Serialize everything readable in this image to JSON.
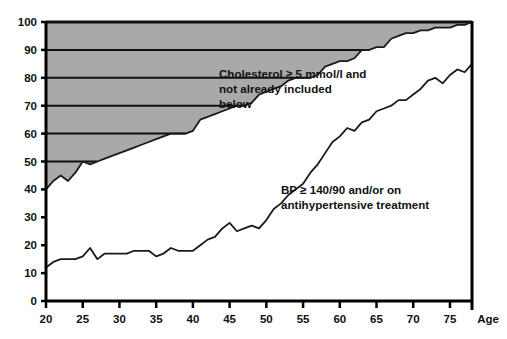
{
  "chart_data": {
    "type": "area",
    "title": "",
    "subtitle": "",
    "xlabel": "Age",
    "ylabel": "",
    "xlim": [
      20,
      78
    ],
    "ylim": [
      0,
      100
    ],
    "xticks": [
      20,
      25,
      30,
      35,
      40,
      45,
      50,
      55,
      60,
      65,
      70,
      75
    ],
    "yticks": [
      0,
      10,
      20,
      30,
      40,
      50,
      60,
      70,
      80,
      90,
      100
    ],
    "grid": "horizontal gridlines at 50, 60, 70, 80, 90, 100 drawn only inside the shaded region",
    "legend_position": "inline annotations inside plot",
    "fill_color": "#a9a9a9",
    "line_color": "#1a1a1a",
    "axis_color": "#000000",
    "background": "#ffffff",
    "annotations": [
      {
        "name": "cholesterol-annotation",
        "text_lines": [
          "Cholesterol ≥ 5 mmol/l and",
          "not already included",
          "below"
        ],
        "x_px": 219,
        "y_px": 78
      },
      {
        "name": "bp-annotation",
        "text_lines": [
          "BP ≥ 140/90 and/or on",
          "antihypertensive treatment"
        ],
        "x_px": 281,
        "y_px": 194
      }
    ],
    "series": [
      {
        "name": "Cholesterol ≥ 5 mmol/l and not already included below",
        "filled": true,
        "x": [
          20,
          21,
          22,
          23,
          24,
          25,
          26,
          27,
          28,
          29,
          30,
          31,
          32,
          33,
          34,
          35,
          36,
          37,
          38,
          39,
          40,
          41,
          42,
          43,
          44,
          45,
          46,
          47,
          48,
          49,
          50,
          51,
          52,
          53,
          54,
          55,
          56,
          57,
          58,
          59,
          60,
          61,
          62,
          63,
          64,
          65,
          66,
          67,
          68,
          69,
          70,
          71,
          72,
          73,
          74,
          75,
          76,
          77,
          78
        ],
        "values": [
          40,
          43,
          45,
          43,
          46,
          50,
          49,
          50,
          51,
          52,
          53,
          54,
          55,
          56,
          57,
          58,
          59,
          60,
          60,
          60,
          61,
          65,
          66,
          67,
          68,
          69,
          70,
          70,
          71,
          74,
          75,
          76,
          77,
          79,
          80,
          80,
          80,
          81,
          84,
          85,
          86,
          86,
          87,
          90,
          90,
          91,
          91,
          94,
          95,
          96,
          96,
          97,
          97,
          98,
          98,
          98,
          99,
          99,
          100
        ]
      },
      {
        "name": "BP ≥ 140/90 and/or on antihypertensive treatment",
        "filled": false,
        "x": [
          20,
          21,
          22,
          23,
          24,
          25,
          26,
          27,
          28,
          29,
          30,
          31,
          32,
          33,
          34,
          35,
          36,
          37,
          38,
          39,
          40,
          41,
          42,
          43,
          44,
          45,
          46,
          47,
          48,
          49,
          50,
          51,
          52,
          53,
          54,
          55,
          56,
          57,
          58,
          59,
          60,
          61,
          62,
          63,
          64,
          65,
          66,
          67,
          68,
          69,
          70,
          71,
          72,
          73,
          74,
          75,
          76,
          77,
          78
        ],
        "values": [
          12,
          14,
          15,
          15,
          15,
          16,
          19,
          15,
          17,
          17,
          17,
          17,
          18,
          18,
          18,
          16,
          17,
          19,
          18,
          18,
          18,
          20,
          22,
          23,
          26,
          28,
          25,
          26,
          27,
          26,
          29,
          33,
          35,
          38,
          40,
          42,
          46,
          49,
          53,
          57,
          59,
          62,
          61,
          64,
          65,
          68,
          69,
          70,
          72,
          72,
          74,
          76,
          79,
          80,
          78,
          81,
          83,
          82,
          85
        ]
      }
    ]
  },
  "axes": {
    "y_tick_labels": [
      "100",
      "90",
      "80",
      "70",
      "60",
      "50",
      "40",
      "30",
      "20",
      "10",
      "0"
    ],
    "x_tick_labels": [
      "20",
      "25",
      "30",
      "35",
      "40",
      "45",
      "50",
      "55",
      "60",
      "65",
      "70",
      "75"
    ],
    "x_axis_name": "Age"
  }
}
